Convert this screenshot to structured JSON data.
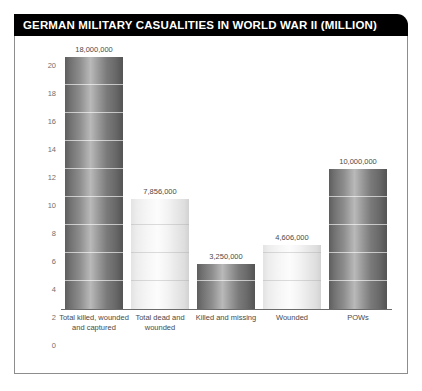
{
  "title": "GERMAN MILITARY CASUALITIES IN WORLD WAR II (MILLION)",
  "colors": {
    "title_bar_background": "#000000",
    "title_text": "#ffffff",
    "frame_border": "#8d8d8d",
    "axis": "#6b6b6b",
    "tick_text": "#6f6f6f",
    "label_text": "#4a4a4a",
    "bar_dark": "#7a7a7a",
    "bar_light": "#f2f2f2"
  },
  "chart_data": {
    "type": "bar",
    "title": "GERMAN MILITARY CASUALITIES IN WORLD WAR II (MILLION)",
    "xlabel": "",
    "ylabel": "",
    "ylim": [
      0,
      20
    ],
    "yticks": [
      0,
      2,
      4,
      6,
      8,
      10,
      12,
      14,
      16,
      18,
      20
    ],
    "grid": true,
    "legend": "none",
    "categories": [
      "Total killed, wounded and captured",
      "Total dead and wounded",
      "Killed and missing",
      "Wounded",
      "POWs"
    ],
    "values": [
      18,
      7.856,
      3.25,
      4.606,
      10
    ],
    "value_labels": [
      "18,000,000",
      "7,856,000",
      "3,250,000",
      "4,606,000",
      "10,000,000"
    ],
    "bar_shades": [
      "dark",
      "light",
      "dark",
      "light",
      "dark"
    ]
  }
}
